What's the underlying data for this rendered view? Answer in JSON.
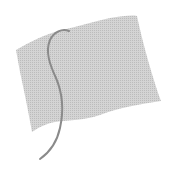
{
  "image": {
    "subject": "waving flag icon",
    "icon": "flag-icon",
    "colors": {
      "background": "#ffffff",
      "flag_fill": "#d2d2d2",
      "flag_dots": "#bdbdbd",
      "pole": "#8a8a8a"
    }
  }
}
